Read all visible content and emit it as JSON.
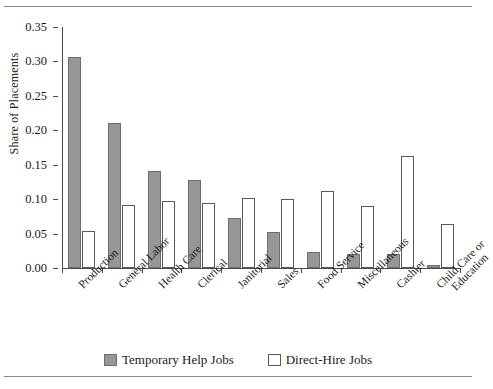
{
  "chart_data": {
    "type": "bar",
    "title": "",
    "xlabel": "",
    "ylabel": "Share of Placements",
    "ylim": [
      0.0,
      0.35
    ],
    "ytick_labels": [
      "0.00",
      "0.05",
      "0.10",
      "0.15",
      "0.20",
      "0.25",
      "0.30",
      "0.35"
    ],
    "ytick_values": [
      0.0,
      0.05,
      0.1,
      0.15,
      0.2,
      0.25,
      0.3,
      0.35
    ],
    "grid": false,
    "legend_position": "bottom-center",
    "categories": [
      "Production",
      "General Labor",
      "Health Care",
      "Clerical",
      "Janitorial",
      "Sales",
      "Food Service",
      "Miscellaneous",
      "Cashier",
      "Child Care or Education"
    ],
    "category_lines": [
      [
        "Production"
      ],
      [
        "General Labor"
      ],
      [
        "Health Care"
      ],
      [
        "Clerical"
      ],
      [
        "Janitorial"
      ],
      [
        "Sales"
      ],
      [
        "Food Service"
      ],
      [
        "Miscellaneous"
      ],
      [
        "Cashier"
      ],
      [
        "Child Care or",
        "Education"
      ]
    ],
    "series": [
      {
        "name": "Temporary Help Jobs",
        "color": "#969696",
        "values": [
          0.307,
          0.211,
          0.141,
          0.128,
          0.073,
          0.053,
          0.023,
          0.02,
          0.02,
          0.004
        ]
      },
      {
        "name": "Direct-Hire Jobs",
        "color": "#ffffff",
        "values": [
          0.054,
          0.091,
          0.098,
          0.094,
          0.101,
          0.1,
          0.112,
          0.09,
          0.163,
          0.064
        ]
      }
    ]
  },
  "legend": {
    "items": [
      {
        "label": "Temporary Help Jobs",
        "style": "temp"
      },
      {
        "label": "Direct-Hire Jobs",
        "style": "direct"
      }
    ]
  }
}
